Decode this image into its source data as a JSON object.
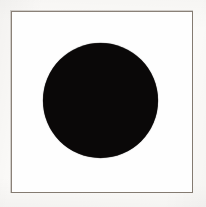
{
  "figure": {
    "title": "Black Disc",
    "description": "A solid black filled circle centered inside a thin rectangular frame on a white field.",
    "canvas": {
      "width_px": 206,
      "height_px": 207,
      "background_color": "#fbfaf8"
    },
    "frame": {
      "name": "rectangular-frame",
      "stroke_color": "#8a8178",
      "stroke_width_px": 1.5,
      "left_px": 11,
      "top_px": 11,
      "width_px": 182,
      "height_px": 182,
      "fill_color": "#ffffff"
    },
    "field": {
      "name": "inner-white-field",
      "fill_color": "#fefefe"
    },
    "shape": {
      "name": "black-disc",
      "type": "circle",
      "fill_color": "#0a0808",
      "center_x_px": 101,
      "center_y_px": 101,
      "diameter_px": 115,
      "radius_px": 57.5
    }
  }
}
